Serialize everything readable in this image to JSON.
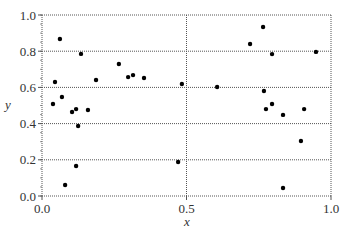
{
  "chart_data": {
    "type": "scatter",
    "title": "",
    "xlabel": "x",
    "ylabel": "y",
    "xlim": [
      0.0,
      1.0
    ],
    "ylim": [
      0.0,
      1.0
    ],
    "x_ticks": [
      0.0,
      0.5,
      1.0
    ],
    "x_tick_labels": [
      "0.0",
      "0.5",
      "1.0"
    ],
    "y_ticks": [
      0.0,
      0.2,
      0.4,
      0.6,
      0.8,
      1.0
    ],
    "y_tick_labels": [
      "0.0",
      "0.2",
      "0.4",
      "0.6",
      "0.8",
      "1.0"
    ],
    "grid": true,
    "grid_style": "dotted",
    "legend": null,
    "marker_color": "#000000",
    "series": [
      {
        "name": "points",
        "points": [
          {
            "x": 0.038,
            "y": 0.508
          },
          {
            "x": 0.045,
            "y": 0.63
          },
          {
            "x": 0.062,
            "y": 0.867
          },
          {
            "x": 0.069,
            "y": 0.547
          },
          {
            "x": 0.08,
            "y": 0.061
          },
          {
            "x": 0.104,
            "y": 0.464
          },
          {
            "x": 0.118,
            "y": 0.48
          },
          {
            "x": 0.118,
            "y": 0.166
          },
          {
            "x": 0.125,
            "y": 0.387
          },
          {
            "x": 0.135,
            "y": 0.785
          },
          {
            "x": 0.159,
            "y": 0.475
          },
          {
            "x": 0.187,
            "y": 0.641
          },
          {
            "x": 0.266,
            "y": 0.729
          },
          {
            "x": 0.298,
            "y": 0.657
          },
          {
            "x": 0.315,
            "y": 0.668
          },
          {
            "x": 0.353,
            "y": 0.652
          },
          {
            "x": 0.471,
            "y": 0.188
          },
          {
            "x": 0.484,
            "y": 0.619
          },
          {
            "x": 0.606,
            "y": 0.602
          },
          {
            "x": 0.72,
            "y": 0.84
          },
          {
            "x": 0.765,
            "y": 0.934
          },
          {
            "x": 0.768,
            "y": 0.58
          },
          {
            "x": 0.775,
            "y": 0.48
          },
          {
            "x": 0.796,
            "y": 0.784
          },
          {
            "x": 0.796,
            "y": 0.508
          },
          {
            "x": 0.834,
            "y": 0.448
          },
          {
            "x": 0.834,
            "y": 0.044
          },
          {
            "x": 0.896,
            "y": 0.304
          },
          {
            "x": 0.907,
            "y": 0.48
          },
          {
            "x": 0.948,
            "y": 0.796
          }
        ]
      }
    ]
  },
  "colors": {
    "background": "#ffffff",
    "grid": "#555555",
    "axis": "#555555",
    "text": "#333333",
    "marker": "#000000"
  }
}
